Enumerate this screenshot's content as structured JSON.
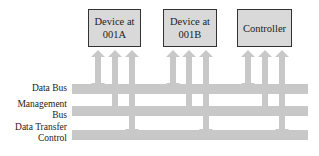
{
  "diagram": {
    "type": "bus-architecture",
    "devices": [
      {
        "line1": "Device at",
        "line2": "001A"
      },
      {
        "line1": "Device at",
        "line2": "001B"
      },
      {
        "line1": "Controller",
        "line2": ""
      }
    ],
    "buses": [
      {
        "label_line1": "Data Bus",
        "label_line2": ""
      },
      {
        "label_line1": "Management",
        "label_line2": "Bus"
      },
      {
        "label_line1": "Data Transfer",
        "label_line2": "Control"
      }
    ],
    "connections_per_device": [
      {
        "bus": "Data Bus",
        "direction": "bidirectional"
      },
      {
        "bus": "Management Bus",
        "direction": "to-device"
      },
      {
        "bus": "Data Transfer Control",
        "direction": "bidirectional"
      }
    ],
    "colors": {
      "bus": "#c8c8c8",
      "box_fill": "#d9d9d9",
      "box_border": "#333333",
      "text": "#222222"
    }
  }
}
